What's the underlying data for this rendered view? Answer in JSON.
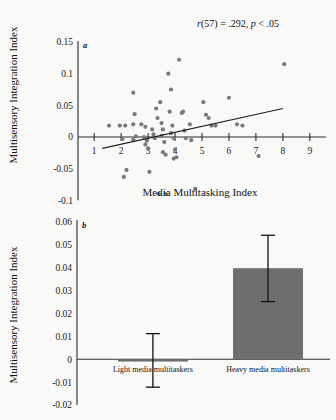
{
  "figure": {
    "background_color": "#f9f9f8",
    "point_color": "#7a7a7a",
    "bar_color": "#6e6e6e",
    "line_color": "#1f1f1f"
  },
  "panel_a": {
    "letter": "a",
    "annotation": "r(57) = .292, p < .05",
    "annotation_parts": {
      "r": "r",
      "df": "(57) = .292, ",
      "p": "p",
      "pval": " < .05"
    }
  },
  "panel_b": {
    "letter": "b"
  },
  "chart_data": [
    {
      "type": "scatter",
      "panel": "a",
      "title": "",
      "xlabel": "Media Multitasking Index",
      "ylabel": "Multisensory Integration Index",
      "xlim": [
        0.4,
        9.6
      ],
      "ylim": [
        -0.105,
        0.155
      ],
      "xticks": [
        1,
        2,
        3,
        4,
        5,
        6,
        7,
        8,
        9
      ],
      "xticklabels": [
        "1",
        "2",
        "3",
        "4",
        "5",
        "6",
        "7",
        "8",
        "9"
      ],
      "yticks": [
        -0.1,
        -0.05,
        0,
        0.05,
        0.1,
        0.15
      ],
      "yticklabels": [
        "-0.1",
        "-0.05",
        "0",
        "0.05",
        "0.1",
        "0.15"
      ],
      "grid": false,
      "legend": "none",
      "annotation": "r(57) = .292, p < .05",
      "statistics": {
        "r": 0.292,
        "df": 57,
        "n": 59,
        "p_text": "< .05"
      },
      "points": [
        [
          1.55,
          0.018
        ],
        [
          1.95,
          0.018
        ],
        [
          2.15,
          0.018
        ],
        [
          2.05,
          -0.003
        ],
        [
          2.2,
          -0.052
        ],
        [
          2.1,
          -0.063
        ],
        [
          2.45,
          0.07
        ],
        [
          2.5,
          0.036
        ],
        [
          2.45,
          0.02
        ],
        [
          2.55,
          0.001
        ],
        [
          2.45,
          -0.004
        ],
        [
          2.75,
          0.02
        ],
        [
          2.9,
          0.016
        ],
        [
          2.85,
          0.0
        ],
        [
          2.95,
          -0.006
        ],
        [
          2.9,
          -0.012
        ],
        [
          3.0,
          -0.018
        ],
        [
          3.05,
          -0.055
        ],
        [
          3.15,
          0.012
        ],
        [
          3.2,
          0.004
        ],
        [
          3.25,
          -0.002
        ],
        [
          3.3,
          0.045
        ],
        [
          3.35,
          0.03
        ],
        [
          3.45,
          0.055
        ],
        [
          3.5,
          0.022
        ],
        [
          3.55,
          0.012
        ],
        [
          3.5,
          0.002
        ],
        [
          3.6,
          -0.008
        ],
        [
          3.55,
          -0.024
        ],
        [
          3.65,
          -0.028
        ],
        [
          3.4,
          -0.09
        ],
        [
          3.65,
          -0.09
        ],
        [
          3.75,
          0.1
        ],
        [
          3.85,
          0.075
        ],
        [
          3.8,
          0.04
        ],
        [
          3.9,
          0.018
        ],
        [
          3.85,
          0.006
        ],
        [
          3.95,
          -0.002
        ],
        [
          4.0,
          -0.02
        ],
        [
          4.05,
          -0.032
        ],
        [
          3.95,
          -0.034
        ],
        [
          4.15,
          0.122
        ],
        [
          4.25,
          0.038
        ],
        [
          4.3,
          0.04
        ],
        [
          4.35,
          0.01
        ],
        [
          4.4,
          -0.002
        ],
        [
          4.55,
          0.02
        ],
        [
          4.6,
          -0.005
        ],
        [
          4.75,
          -0.082
        ],
        [
          5.05,
          0.055
        ],
        [
          5.15,
          0.035
        ],
        [
          5.25,
          0.03
        ],
        [
          5.35,
          0.018
        ],
        [
          5.5,
          0.018
        ],
        [
          6.0,
          0.062
        ],
        [
          6.3,
          0.02
        ],
        [
          6.5,
          0.018
        ],
        [
          7.1,
          -0.03
        ],
        [
          8.05,
          0.115
        ]
      ],
      "fit_line": {
        "x": [
          1.3,
          8.0
        ],
        "y": [
          -0.018,
          0.045
        ]
      }
    },
    {
      "type": "bar",
      "panel": "b",
      "title": "",
      "xlabel": "",
      "ylabel": "Multisensory Integration Index",
      "categories": [
        "Light media multitaskers",
        "Heavy media multitaskers"
      ],
      "values": [
        -0.001,
        0.0398
      ],
      "error_low": [
        -0.0122,
        0.0252
      ],
      "error_high": [
        0.0112,
        0.0542
      ],
      "ylim": [
        -0.02,
        0.06
      ],
      "yticks": [
        -0.02,
        -0.01,
        0,
        0.01,
        0.02,
        0.03,
        0.04,
        0.05,
        0.06
      ],
      "yticklabels": [
        "-0.02",
        "-0.01",
        "0",
        "0.01",
        "0.02",
        "0.03",
        "0.04",
        "0.05",
        "0.06"
      ],
      "grid": false,
      "legend": "none"
    }
  ]
}
